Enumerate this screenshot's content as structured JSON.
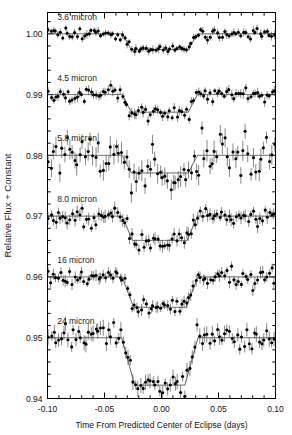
{
  "figure": {
    "title": "",
    "background": "#ffffff",
    "width": 292,
    "height": 435
  },
  "axes": {
    "xlabel": "Time From Predicted Center of Eclipse (days)",
    "ylabel": "Relative Flux + Constant",
    "xticklabels": [
      "-0.10",
      "-0.05",
      "0.00",
      "0.05",
      "0.10"
    ],
    "xtickvalues": [
      -0.1,
      -0.05,
      0.0,
      0.05,
      0.1
    ],
    "yticklabels": [
      "0.94",
      "0.95",
      "0.96",
      "0.97",
      "0.98",
      "0.99",
      "1.00"
    ],
    "ytickvalues": [
      0.94,
      0.95,
      0.96,
      0.97,
      0.98,
      0.99,
      1.0
    ],
    "xlim": [
      -0.1,
      0.1
    ],
    "ylim": [
      0.94,
      1.0035
    ],
    "minor_ticks_x": 5,
    "minor_ticks_y": 5,
    "frame_color": "#000000",
    "tick_direction": "in"
  },
  "chart_data": {
    "type": "scatter",
    "title": "",
    "xlabel": "Time From Predicted Center of Eclipse (days)",
    "ylabel": "Relative Flux + Constant",
    "xlim": [
      -0.1,
      0.1
    ],
    "ylim": [
      0.94,
      1.0035
    ],
    "grid": false,
    "legend": "none",
    "marker": "filled-circle",
    "errorbars": true,
    "model_color": "#444444",
    "point_color": "#000000",
    "series": [
      {
        "name": "3.6 micron",
        "label": "3.6 micron",
        "label_x": -0.0915,
        "label_y": 1.0023,
        "baseline": 1.0,
        "depth": 0.0026,
        "ingress_start": -0.0345,
        "ingress_end": -0.0265,
        "egress_start": 0.0235,
        "egress_end": 0.0315,
        "scatter": 0.00045,
        "errbar": 0.00055,
        "seed": 11,
        "npoints": 96
      },
      {
        "name": "4.5 micron",
        "label": "4.5 micron",
        "label_x": -0.0915,
        "label_y": 0.9923,
        "baseline": 0.99,
        "depth": 0.0029,
        "ingress_start": -0.0345,
        "ingress_end": -0.0265,
        "egress_start": 0.0235,
        "egress_end": 0.0315,
        "scatter": 0.00055,
        "errbar": 0.00065,
        "seed": 23,
        "npoints": 96
      },
      {
        "name": "5.8 micron",
        "label": "5.8 micron",
        "label_x": -0.0915,
        "label_y": 0.9824,
        "baseline": 0.98,
        "depth": 0.0029,
        "ingress_start": -0.0345,
        "ingress_end": -0.0265,
        "egress_start": 0.0235,
        "egress_end": 0.0315,
        "scatter": 0.00155,
        "errbar": 0.0014,
        "seed": 37,
        "npoints": 88
      },
      {
        "name": "8.0 micron",
        "label": "8.0 micron",
        "label_x": -0.0915,
        "label_y": 0.9723,
        "baseline": 0.97,
        "depth": 0.004,
        "ingress_start": -0.0345,
        "ingress_end": -0.0255,
        "egress_start": 0.0225,
        "egress_end": 0.0315,
        "scatter": 0.00075,
        "errbar": 0.00085,
        "seed": 53,
        "npoints": 96
      },
      {
        "name": "16 micron",
        "label": "16 micron",
        "label_x": -0.0915,
        "label_y": 0.9623,
        "baseline": 0.96,
        "depth": 0.005,
        "ingress_start": -0.0345,
        "ingress_end": -0.0245,
        "egress_start": 0.0215,
        "egress_end": 0.032,
        "scatter": 0.0007,
        "errbar": 0.0008,
        "seed": 71,
        "npoints": 96
      },
      {
        "name": "24 micron",
        "label": "24 micron",
        "label_x": -0.0915,
        "label_y": 0.9523,
        "baseline": 0.95,
        "depth": 0.0078,
        "ingress_start": -0.035,
        "ingress_end": -0.0235,
        "egress_start": 0.0205,
        "egress_end": 0.032,
        "scatter": 0.0009,
        "errbar": 0.00105,
        "seed": 97,
        "npoints": 92
      }
    ]
  }
}
